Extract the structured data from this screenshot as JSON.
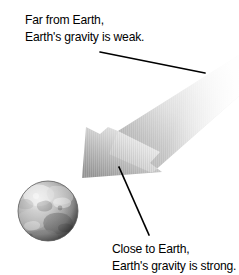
{
  "figure": {
    "background_color": "#ffffff"
  },
  "captions": {
    "far": {
      "name": "far-from-earth-caption",
      "line1": "Far from Earth,",
      "line2": "Earth's gravity is weak."
    },
    "close": {
      "name": "close-to-earth-caption",
      "line1": "Close to Earth,",
      "line2": "Earth's gravity is strong."
    }
  },
  "arrow": {
    "label": "gravity-gradient-arrow",
    "direction": "down-left",
    "description": "Wide tapering band pointing from upper right toward Earth at lower left",
    "gradient_light": "#f4f4f4",
    "gradient_mid": "#d8d8d8",
    "gradient_dark": "#9a9a9a",
    "outline_color": "#8c8c8c"
  },
  "earth": {
    "label": "earth-globe",
    "description": "Grayscale textured sphere representing Earth",
    "center_x": 48,
    "center_y": 211,
    "radius": 30,
    "base_color": "#a9a9a9",
    "highlight_color": "#e2e2e2",
    "shadow_color": "#4a4a4a"
  },
  "leader_lines": {
    "far": {
      "label": "far-caption-leader-line",
      "x1": 100,
      "y1": 52,
      "x2": 205,
      "y2": 73
    },
    "close": {
      "label": "close-caption-leader-line",
      "x1": 119,
      "y1": 167,
      "x2": 149,
      "y2": 235
    },
    "color": "#000000",
    "width": 1.6
  }
}
